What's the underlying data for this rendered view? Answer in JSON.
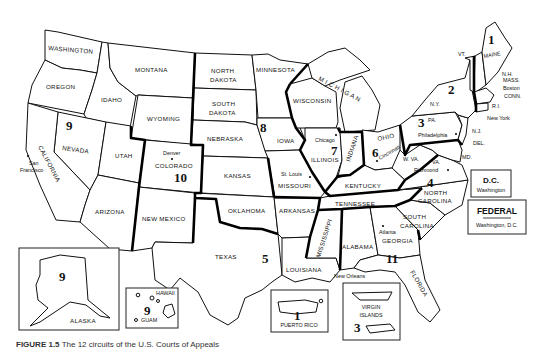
{
  "caption": {
    "figure": "FIGURE 1.5",
    "text": "The 12 circuits of the U.S. Courts of Appeals"
  },
  "states": {
    "washington": "WASHINGTON",
    "oregon": "OREGON",
    "california": "CALIFORNIA",
    "nevada": "NEVADA",
    "idaho": "IDAHO",
    "montana": "MONTANA",
    "wyoming": "WYOMING",
    "utah": "UTAH",
    "colorado": "COLORADO",
    "arizona": "ARIZONA",
    "new_mexico": "NEW MEXICO",
    "north_dakota_1": "NORTH",
    "north_dakota_2": "DAKOTA",
    "south_dakota_1": "SOUTH",
    "south_dakota_2": "DAKOTA",
    "nebraska": "NEBRASKA",
    "kansas": "KANSAS",
    "oklahoma": "OKLAHOMA",
    "texas": "TEXAS",
    "minnesota": "MINNESOTA",
    "iowa": "IOWA",
    "missouri": "MISSOURI",
    "arkansas": "ARKANSAS",
    "louisiana": "LOUISIANA",
    "wisconsin": "WISCONSIN",
    "illinois": "ILLINOIS",
    "indiana": "INDIANA",
    "michigan": "M I C H I G A N",
    "ohio": "OHIO",
    "kentucky": "KENTUCKY",
    "tennessee": "TENNESSEE",
    "mississippi": "MISSISSIPPI",
    "alabama": "ALABAMA",
    "georgia": "GEORGIA",
    "florida": "FLORIDA",
    "south_carolina_1": "SOUTH",
    "south_carolina_2": "CAROLINA",
    "north_carolina_1": "NORTH",
    "north_carolina_2": "CAROLINA",
    "virginia": "VA.",
    "west_virginia": "W. VA.",
    "maryland": "MD.",
    "delaware": "DEL.",
    "new_jersey": "N.J.",
    "pennsylvania": "PA.",
    "new_york": "N.Y.",
    "vermont": "VT.",
    "new_hampshire": "N.H.",
    "maine": "MAINE",
    "massachusetts": "MASS.",
    "connecticut": "CONN.",
    "rhode_island": "R.I.",
    "alaska": "ALASKA",
    "hawaii": "HAWAII",
    "guam": "GUAM",
    "puerto_rico": "PUERTO RICO",
    "virgin_islands_1": "VIRGIN",
    "virgin_islands_2": "ISLANDS"
  },
  "cities": {
    "san_francisco_1": "San",
    "san_francisco_2": "Francisco",
    "denver": "Denver",
    "st_louis": "St. Louis",
    "chicago": "Chicago",
    "cincinnati": "Cincinnati",
    "philadelphia": "Philadelphia",
    "new_york": "New York",
    "boston": "Boston",
    "richmond": "Richmond",
    "atlanta": "Atlanta",
    "new_orleans": "New Orleans"
  },
  "circuits": {
    "c1": "1",
    "c1_pr": "1",
    "c2": "2",
    "c3": "3",
    "c3_vi": "3",
    "c4": "4",
    "c5": "5",
    "c6": "6",
    "c7": "7",
    "c8": "8",
    "c9": "9",
    "c9_ak": "9",
    "c9_hi": "9",
    "c10": "10",
    "c11": "11"
  },
  "dc_box": {
    "title": "D.C.",
    "subtitle": "Washington"
  },
  "federal_box": {
    "title": "FEDERAL",
    "subtitle": "Washington, D.C."
  }
}
